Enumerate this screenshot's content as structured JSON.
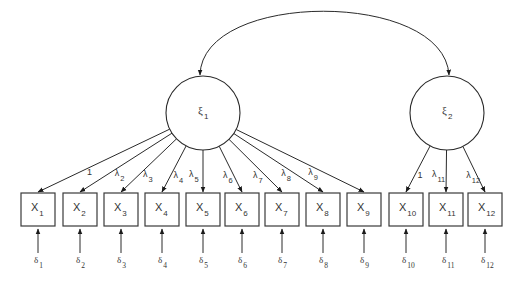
{
  "colors": {
    "line": "#2a2a2a",
    "box_border": "#3a3a3a",
    "text": "#333333",
    "background": "#ffffff"
  },
  "factors": [
    {
      "id": "xi1",
      "symbol": "ξ",
      "sub": "1",
      "cx": 203,
      "cy": 113,
      "r": 37
    },
    {
      "id": "xi2",
      "symbol": "ξ",
      "sub": "2",
      "cx": 447,
      "cy": 113,
      "r": 37
    }
  ],
  "factor_covariance": {
    "from": "xi1",
    "to": "xi2",
    "bidirectional": true
  },
  "indicators": [
    {
      "symbol": "X",
      "sub": "1",
      "x": 21,
      "factor": "xi1",
      "loading": "1",
      "loading_sub": "",
      "error_symbol": "δ",
      "error_sub": "1"
    },
    {
      "symbol": "X",
      "sub": "2",
      "x": 63,
      "factor": "xi1",
      "loading": "λ",
      "loading_sub": "2",
      "error_symbol": "δ",
      "error_sub": "2"
    },
    {
      "symbol": "X",
      "sub": "3",
      "x": 104,
      "factor": "xi1",
      "loading": "λ",
      "loading_sub": "3",
      "error_symbol": "δ",
      "error_sub": "3"
    },
    {
      "symbol": "X",
      "sub": "4",
      "x": 145,
      "factor": "xi1",
      "loading": "λ",
      "loading_sub": "4",
      "error_symbol": "δ",
      "error_sub": "4"
    },
    {
      "symbol": "X",
      "sub": "5",
      "x": 186,
      "factor": "xi1",
      "loading": "λ",
      "loading_sub": "5",
      "error_symbol": "δ",
      "error_sub": "5"
    },
    {
      "symbol": "X",
      "sub": "6",
      "x": 225,
      "factor": "xi1",
      "loading": "λ",
      "loading_sub": "6",
      "error_symbol": "δ",
      "error_sub": "6"
    },
    {
      "symbol": "X",
      "sub": "7",
      "x": 265,
      "factor": "xi1",
      "loading": "λ",
      "loading_sub": "7",
      "error_symbol": "δ",
      "error_sub": "7"
    },
    {
      "symbol": "X",
      "sub": "8",
      "x": 306,
      "factor": "xi1",
      "loading": "λ",
      "loading_sub": "8",
      "error_symbol": "δ",
      "error_sub": "8"
    },
    {
      "symbol": "X",
      "sub": "9",
      "x": 347,
      "factor": "xi1",
      "loading": "λ",
      "loading_sub": "9",
      "error_symbol": "δ",
      "error_sub": "9"
    },
    {
      "symbol": "X",
      "sub": "10",
      "x": 389,
      "factor": "xi2",
      "loading": "1",
      "loading_sub": "",
      "error_symbol": "δ",
      "error_sub": "10"
    },
    {
      "symbol": "X",
      "sub": "11",
      "x": 429,
      "factor": "xi2",
      "loading": "λ",
      "loading_sub": "11",
      "error_symbol": "δ",
      "error_sub": "11"
    },
    {
      "symbol": "X",
      "sub": "12",
      "x": 468,
      "factor": "xi2",
      "loading": "λ",
      "loading_sub": "12",
      "error_symbol": "δ",
      "error_sub": "12"
    }
  ],
  "layout": {
    "box_top": 193,
    "box_w": 34,
    "box_h": 33,
    "error_arrow_top": 229,
    "error_arrow_bottom": 253,
    "error_label_y": 263
  }
}
